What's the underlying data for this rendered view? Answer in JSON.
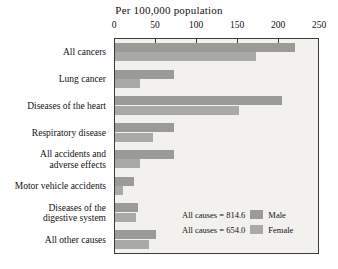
{
  "chart_data": {
    "type": "bar",
    "title": "Per 100,000 population",
    "xlabel": "",
    "ylabel": "",
    "orientation": "horizontal",
    "grid": false,
    "legend_position": "inside-bottom-right",
    "xlim": [
      0,
      250
    ],
    "xticks": [
      0,
      50,
      100,
      150,
      200,
      250
    ],
    "categories": [
      "All cancers",
      "Lung cancer",
      "Diseases of the heart",
      "Respiratory disease",
      "All accidents and\nadverse effects",
      "Motor vehicle accidents",
      "Diseases of the\ndigestive system",
      "All other causes"
    ],
    "series": [
      {
        "name": "Male",
        "color": "#9a9a96",
        "values": [
          220,
          72,
          204,
          72,
          72,
          23,
          28,
          50
        ]
      },
      {
        "name": "Female",
        "color": "#a9a9a5",
        "values": [
          172,
          31,
          151,
          46,
          30,
          10,
          26,
          41
        ]
      }
    ],
    "annotations": [
      {
        "label": "All causes = 814.6",
        "series": "Male"
      },
      {
        "label": "All causes = 654.0",
        "series": "Female"
      }
    ]
  },
  "legend": {
    "rows": [
      {
        "note": "All causes = 814.6",
        "name": "Male"
      },
      {
        "note": "All causes = 654.0",
        "name": "Female"
      }
    ]
  }
}
